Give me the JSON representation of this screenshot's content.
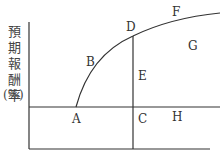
{
  "diagram": {
    "y_axis_label_chars": [
      "預",
      "期",
      "報",
      "酬",
      "率"
    ],
    "y_axis_unit": "(%)",
    "points": {
      "A": "A",
      "B": "B",
      "C": "C",
      "D": "D",
      "E": "E",
      "F": "F",
      "G": "G",
      "H": "H"
    },
    "colors": {
      "line": "#333333",
      "text": "#333333"
    }
  }
}
